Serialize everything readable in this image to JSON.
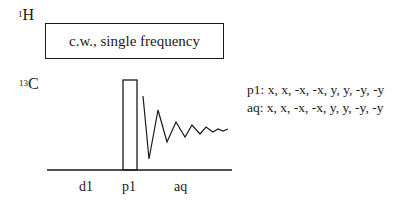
{
  "channels": {
    "proton": {
      "mass": "1",
      "element": "H"
    },
    "carbon": {
      "mass": "13",
      "element": "C"
    }
  },
  "decoupling_box": {
    "label": "c.w., single frequency"
  },
  "phase_cycle": {
    "p1": "p1: x, x, -x, -x, y, y, -y, -y",
    "aq": "aq: x, x, -x, -x, y, y, -y, -y"
  },
  "timing_labels": {
    "d1": "d1",
    "p1": "p1",
    "aq": "aq"
  },
  "colors": {
    "line": "#1a1a1a",
    "background": "#ffffff"
  }
}
